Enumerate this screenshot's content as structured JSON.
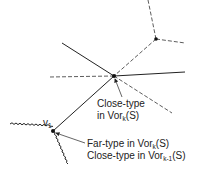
{
  "diagram": {
    "vertices": [
      {
        "id": "v1",
        "label": "v",
        "label_sub": "1",
        "x": 53,
        "y": 131
      },
      {
        "id": "center",
        "x": 114,
        "y": 76
      },
      {
        "id": "upper",
        "x": 156,
        "y": 39
      }
    ],
    "labels": {
      "center_line1": "Close-type",
      "center_line2_pre": "in Vor",
      "center_line2_sub": "k",
      "center_line2_post": "(S)",
      "v1_line1_pre": "Far-type in Vor",
      "v1_line1_sub": "k",
      "v1_line1_post": "(S)",
      "v1_line2_pre": "Close-type in Vor",
      "v1_line2_sub": "k-1",
      "v1_line2_post": "(S)"
    },
    "line_styles": {
      "solid": "Vor_k(S) edge",
      "dashed": "other edge",
      "wavy": "Vor_{k-1}(S) edge"
    },
    "colors": {
      "ink": "#222222",
      "background": "#ffffff"
    }
  }
}
